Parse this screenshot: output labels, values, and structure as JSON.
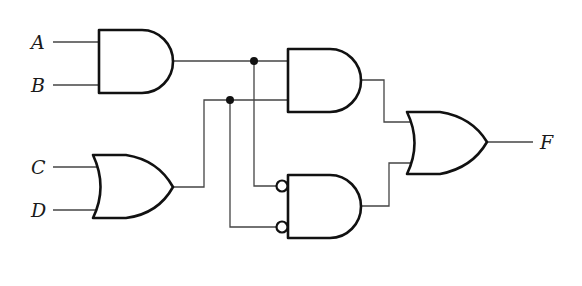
{
  "diagram": {
    "type": "logic-circuit",
    "inputs": [
      {
        "id": "A",
        "label": "A"
      },
      {
        "id": "B",
        "label": "B"
      },
      {
        "id": "C",
        "label": "C"
      },
      {
        "id": "D",
        "label": "D"
      }
    ],
    "output": {
      "id": "F",
      "label": "F"
    },
    "gates": [
      {
        "id": "g1",
        "type": "AND",
        "inputs": [
          "A",
          "B"
        ],
        "output": "AB"
      },
      {
        "id": "g2",
        "type": "OR",
        "inputs": [
          "C",
          "D"
        ],
        "output": "C+D"
      },
      {
        "id": "g3",
        "type": "AND",
        "inputs": [
          "AB",
          "C+D"
        ],
        "output": "AB(C+D)"
      },
      {
        "id": "g4",
        "type": "AND",
        "inputs": [
          "AB",
          "C+D"
        ],
        "inverted_inputs": true,
        "output": "(AB)'(C+D)'"
      },
      {
        "id": "g5",
        "type": "OR",
        "inputs": [
          "g3",
          "g4"
        ],
        "output": "F"
      }
    ],
    "junction_dots": 2,
    "colors": {
      "line": "#111111",
      "wire": "#444444",
      "background": "#ffffff"
    }
  }
}
